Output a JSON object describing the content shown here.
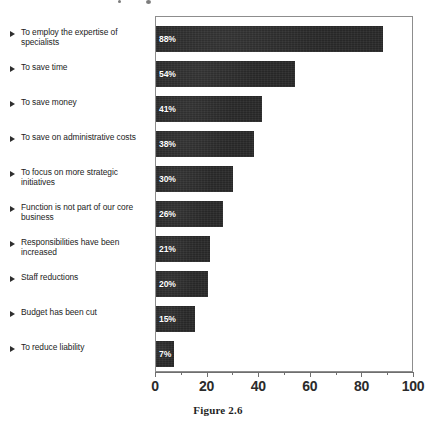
{
  "caption": "Figure 2.6",
  "axis": {
    "tick_labels": [
      "0",
      "20",
      "40",
      "60",
      "80",
      "100"
    ],
    "tick_values": [
      0,
      20,
      40,
      60,
      80,
      100
    ],
    "minor_tick_values": [
      10,
      30,
      50,
      70,
      90
    ]
  },
  "bullet_icon": "triangle-right-icon",
  "colors": {
    "bar": "#272727",
    "bar_label": "#ffffff",
    "axis": "#6f6f6f",
    "frame": "#8d8d8d",
    "text": "#232323",
    "background": "#ffffff"
  },
  "chart_data": {
    "type": "bar",
    "orientation": "horizontal",
    "title": "",
    "subtitle": "",
    "xlabel": "",
    "ylabel": "",
    "xlim": [
      0,
      100
    ],
    "grid": false,
    "legend": null,
    "categories": [
      "To employ the expertise of specialists",
      "To save time",
      "To save money",
      "To save on administrative costs",
      "To focus on more strategic initiatives",
      "Function is not part of our core business",
      "Responsibilities have been increased",
      "Staff reductions",
      "Budget has been cut",
      "To reduce liability"
    ],
    "values": [
      88,
      54,
      41,
      38,
      30,
      26,
      21,
      20,
      15,
      7
    ],
    "value_labels": [
      "88%",
      "54%",
      "41%",
      "38%",
      "30%",
      "26%",
      "21%",
      "20%",
      "15%",
      "7%"
    ]
  }
}
